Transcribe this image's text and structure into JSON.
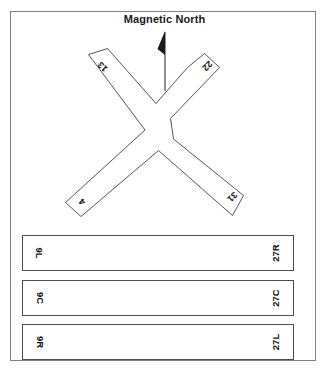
{
  "figure": {
    "title": "Magnetic North",
    "north_arrow_icon": "magnetic-north-arrow-icon",
    "frame_color": "#808080",
    "line_color": "#4d4d4d",
    "text_color": "#111111",
    "background": "#ffffff"
  },
  "crossing_runways": {
    "shape": "x-crossing",
    "arms": [
      {
        "id": "nw",
        "label": "13"
      },
      {
        "id": "ne",
        "label": "22"
      },
      {
        "id": "sw",
        "label": "4"
      },
      {
        "id": "se",
        "label": "31"
      }
    ],
    "pairs": [
      {
        "designators": [
          "13",
          "31"
        ]
      },
      {
        "designators": [
          "22",
          "4"
        ]
      }
    ]
  },
  "parallel_runways": [
    {
      "left_label": "9L",
      "right_label": "27R"
    },
    {
      "left_label": "9C",
      "right_label": "27C"
    },
    {
      "left_label": "9R",
      "right_label": "27L"
    }
  ]
}
